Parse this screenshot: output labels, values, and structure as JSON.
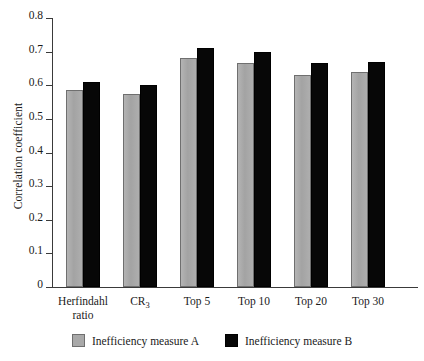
{
  "chart_data": {
    "type": "bar",
    "title": "",
    "xlabel": "",
    "ylabel": "Correlation coefficient",
    "ylim": [
      0,
      0.8
    ],
    "ytick_step": 0.1,
    "yticks": [
      "0.8",
      "0.7",
      "0.6",
      "0.5",
      "0.4",
      "0.3",
      "0.2",
      "0.1",
      "0"
    ],
    "ytick_values": [
      0.8,
      0.7,
      0.6,
      0.5,
      0.4,
      0.3,
      0.2,
      0.1,
      0
    ],
    "grid": false,
    "legend_position": "bottom-center",
    "categories": [
      "Herfindahl ratio",
      "CR3",
      "Top 5",
      "Top 10",
      "Top 20",
      "Top 30"
    ],
    "category_labels": [
      {
        "line1": "Herfindahl",
        "line2": "ratio",
        "base": "",
        "sub": ""
      },
      {
        "line1": "",
        "line2": "",
        "base": "CR",
        "sub": "3"
      },
      {
        "line1": "Top 5",
        "line2": "",
        "base": "",
        "sub": ""
      },
      {
        "line1": "Top 10",
        "line2": "",
        "base": "",
        "sub": ""
      },
      {
        "line1": "Top 20",
        "line2": "",
        "base": "",
        "sub": ""
      },
      {
        "line1": "Top 30",
        "line2": "",
        "base": "",
        "sub": ""
      }
    ],
    "series": [
      {
        "name": "Inefficiency measure A",
        "color": "#a9a9a9",
        "values": [
          0.585,
          0.575,
          0.68,
          0.665,
          0.63,
          0.64
        ]
      },
      {
        "name": "Inefficiency measure B",
        "color": "#070707",
        "values": [
          0.61,
          0.6,
          0.71,
          0.7,
          0.665,
          0.67
        ]
      }
    ]
  },
  "legend": {
    "entries": [
      {
        "label": "Inefficiency measure A",
        "color": "#a9a9a9"
      },
      {
        "label": "Inefficiency measure B",
        "color": "#070707"
      }
    ]
  },
  "colors": {
    "series_a": "#a9a9a9",
    "series_b": "#070707",
    "axis": "#3a3a3a",
    "background": "#ffffff"
  }
}
